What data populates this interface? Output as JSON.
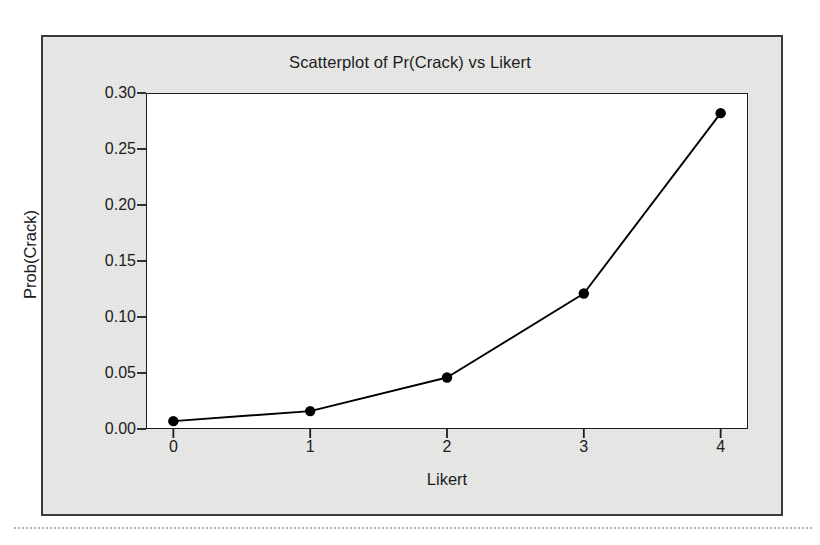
{
  "chart_data": {
    "type": "line",
    "title": "Scatterplot of Pr(Crack) vs Likert",
    "xlabel": "Likert",
    "ylabel": "Prob(Crack)",
    "x": [
      0,
      1,
      2,
      3,
      4
    ],
    "values": [
      0.007,
      0.016,
      0.046,
      0.121,
      0.282
    ],
    "categories": [
      "0",
      "1",
      "2",
      "3",
      "4"
    ],
    "xtick_labels": [
      "0",
      "1",
      "2",
      "3",
      "4"
    ],
    "ytick_labels": [
      "0.00",
      "0.05",
      "0.10",
      "0.15",
      "0.20",
      "0.25",
      "0.30"
    ],
    "ytick_values": [
      0.0,
      0.05,
      0.1,
      0.15,
      0.2,
      0.25,
      0.3
    ],
    "xlim": [
      -0.2,
      4.2
    ],
    "ylim": [
      0.0,
      0.3
    ],
    "grid": false,
    "legend": null,
    "marker": "filled-circle",
    "marker_color": "#000000",
    "line_color": "#000000",
    "plot_background": "#ffffff",
    "panel_background": "#ececeb",
    "frame_color": "#1d1d1d"
  }
}
